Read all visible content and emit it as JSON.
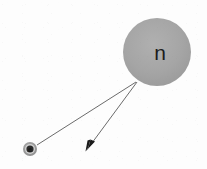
{
  "figure": {
    "type": "particle-decay-diagram",
    "background_color": "#fdfdfd",
    "width": 207,
    "height": 169
  },
  "nucleus": {
    "label": "n",
    "name": "neutron",
    "cx": 157,
    "cy": 52,
    "r": 34,
    "fill_color": "#a3a3a3",
    "label_x": 160,
    "label_y": 60
  },
  "electron": {
    "label": "e",
    "name": "electron",
    "cx": 30,
    "cy": 149,
    "r": 7,
    "ring_color": "#8f8f8f",
    "core_color": "#2b2b2b",
    "label_x": 30,
    "label_y": 151.5
  },
  "tracks": [
    {
      "name": "electron-track",
      "from_x": 136,
      "from_y": 82,
      "to_x": 37,
      "to_y": 145,
      "color": "#6b6b6b",
      "width": 1,
      "arrowhead": false
    },
    {
      "name": "antineutrino-track",
      "from_x": 137,
      "from_y": 82,
      "to_x": 88,
      "to_y": 148,
      "color": "#6b6b6b",
      "width": 1,
      "arrowhead": true
    }
  ],
  "arrowhead": {
    "name": "arrowhead",
    "tip_x": 86,
    "tip_y": 151,
    "color": "#1a1a1a",
    "points": "86,151 95,142 91,140 86,151 87,140 91,140"
  }
}
